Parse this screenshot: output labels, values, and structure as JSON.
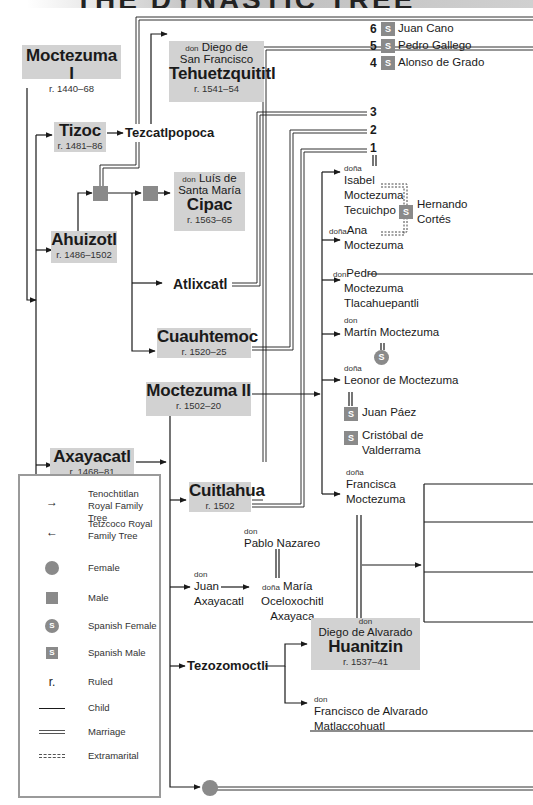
{
  "title": "THE DYNASTIC TREE",
  "people": {
    "moctezuma_i": {
      "name": "Moctezuma I",
      "reign": "r. 1440–68"
    },
    "tehuetzquititl": {
      "prefix": "don",
      "line1": "Diego de",
      "line2": "San Francisco",
      "name": "Tehuetzquititl",
      "reign": "r. 1541–54"
    },
    "tizoc": {
      "name": "Tizoc",
      "reign": "r. 1481–86"
    },
    "tezcatlpopoca": {
      "name": "Tezcatlpopoca"
    },
    "cipac": {
      "prefix": "don",
      "line1": "Luís de",
      "line2": "Santa María",
      "name": "Cipac",
      "reign": "r. 1563–65"
    },
    "ahuizotl": {
      "name": "Ahuizotl",
      "reign": "r. 1486–1502"
    },
    "atlixcatl": {
      "name": "Atlixcatl"
    },
    "cuauhtemoc": {
      "name": "Cuauhtemoc",
      "reign": "r. 1520–25"
    },
    "moctezuma_ii": {
      "name": "Moctezuma II",
      "reign": "r. 1502–20"
    },
    "axayacatl": {
      "name": "Axayacatl",
      "reign": "r. 1468–81"
    },
    "cuitlahua": {
      "name": "Cuitlahua",
      "reign": "r. 1502"
    },
    "pablo_nazareo": {
      "prefix": "don",
      "name": "Pablo Nazareo"
    },
    "juan_axayacatl": {
      "prefix": "don",
      "line1": "Juan",
      "line2": "Axayacatl"
    },
    "maria": {
      "prefix": "doña",
      "line1": "María",
      "line2": "Oceloxochitl",
      "line3": "Axayaca"
    },
    "tezozomoctli": {
      "name": "Tezozomoctli"
    },
    "huanitzin": {
      "prefix": "don",
      "line1": "Diego de Alvarado",
      "name": "Huanitzin",
      "reign": "r. 1537–41"
    },
    "francisco_matlaccohuatl": {
      "prefix": "don",
      "line1": "Francisco de Alvarado",
      "line2": "Matlaccohuatl"
    },
    "isabel": {
      "prefix": "doña",
      "line1": "Isabel",
      "line2": "Moctezuma",
      "line3": "Tecuichpo"
    },
    "hernando_cortes": {
      "badge": "S",
      "line1": "Hernando",
      "line2": "Cortés"
    },
    "ana": {
      "prefix": "doña",
      "line1": "Ana",
      "line2": "Moctezuma"
    },
    "pedro": {
      "prefix": "don",
      "line1": "Pedro",
      "line2": "Moctezuma",
      "line3": "Tlacahuepantli"
    },
    "martin": {
      "prefix": "don",
      "line1": "Martín Moctezuma",
      "spouse_badge": "S"
    },
    "leonor": {
      "prefix": "doña",
      "line1": "Leonor de Moctezuma"
    },
    "juan_paez": {
      "badge": "S",
      "name": "Juan Páez"
    },
    "cristobal": {
      "badge": "S",
      "line1": "Cristóbal de",
      "line2": "Valderrama"
    },
    "francisca": {
      "prefix": "doña",
      "line1": "Francisca",
      "line2": "Moctezuma"
    }
  },
  "isabel_husbands": [
    {
      "num": "6",
      "badge": "S",
      "name": "Juan Cano"
    },
    {
      "num": "5",
      "badge": "S",
      "name": "Pedro Gallego"
    },
    {
      "num": "4",
      "badge": "S",
      "name": "Alonso de Grado"
    },
    {
      "num": "3"
    },
    {
      "num": "2"
    },
    {
      "num": "1"
    }
  ],
  "legend": [
    {
      "symbol": "arrow-right",
      "glyph": "→",
      "label1": "Tenochtitlan",
      "label2": "Royal Family Tree"
    },
    {
      "symbol": "arrow-left",
      "glyph": "←",
      "label1": "Tetzcoco Royal",
      "label2": "Family Tree"
    },
    {
      "symbol": "circle",
      "label1": "Female"
    },
    {
      "symbol": "square",
      "label1": "Male"
    },
    {
      "symbol": "s-circle",
      "glyph": "S",
      "label1": "Spanish Female"
    },
    {
      "symbol": "s-square",
      "glyph": "S",
      "label1": "Spanish Male"
    },
    {
      "symbol": "r",
      "glyph": "r.",
      "label1": "Ruled"
    },
    {
      "symbol": "line-single",
      "label1": "Child"
    },
    {
      "symbol": "line-double",
      "label1": "Marriage"
    },
    {
      "symbol": "line-dashed",
      "label1": "Extramarital"
    }
  ],
  "colors": {
    "box": "#d2d2d2",
    "symbol": "#8a8a8a",
    "line": "#1a1a1a",
    "legend_border": "#9a9a9a"
  }
}
